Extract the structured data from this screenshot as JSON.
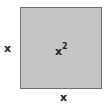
{
  "diagram": {
    "shape": "square",
    "fill_color": "#c4c4c4",
    "border_color": "#6e6e6e",
    "side_label_left": "x",
    "side_label_bottom": "x",
    "area_label_base": "x",
    "area_label_exponent": "2"
  }
}
